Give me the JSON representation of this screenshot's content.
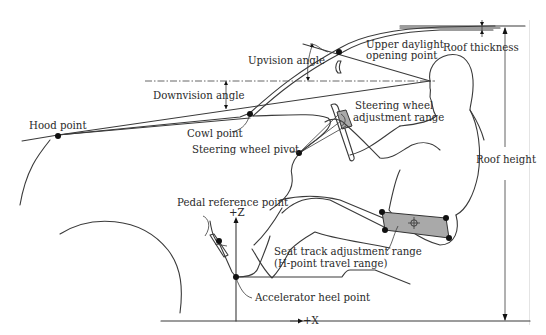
{
  "diagram": {
    "labels": {
      "roof_thickness": "Roof thickness",
      "upper_daylight_line1": "Upper daylight",
      "upper_daylight_line2": "opening point",
      "upvision_angle": "Upvision angle",
      "downvision_angle": "Downvision angle",
      "hood_point": "Hood point",
      "cowl_point": "Cowl point",
      "steering_wheel_pivot": "Steering wheel pivot",
      "steering_adjust_line1": "Steering wheel",
      "steering_adjust_line2": "adjustment range",
      "roof_height": "Roof height",
      "pedal_reference_point": "Pedal reference point",
      "plus_z": "+Z",
      "plus_x": "+X",
      "seat_track_line1": "Seat track adjustment range",
      "seat_track_line2": "(H-point travel range)",
      "accelerator_heel_point": "Accelerator heel point"
    },
    "colors": {
      "line": "#3a3a3a",
      "point": "#111111",
      "adjust_range_fill": "#a9a9a9",
      "background": "#ffffff"
    }
  }
}
